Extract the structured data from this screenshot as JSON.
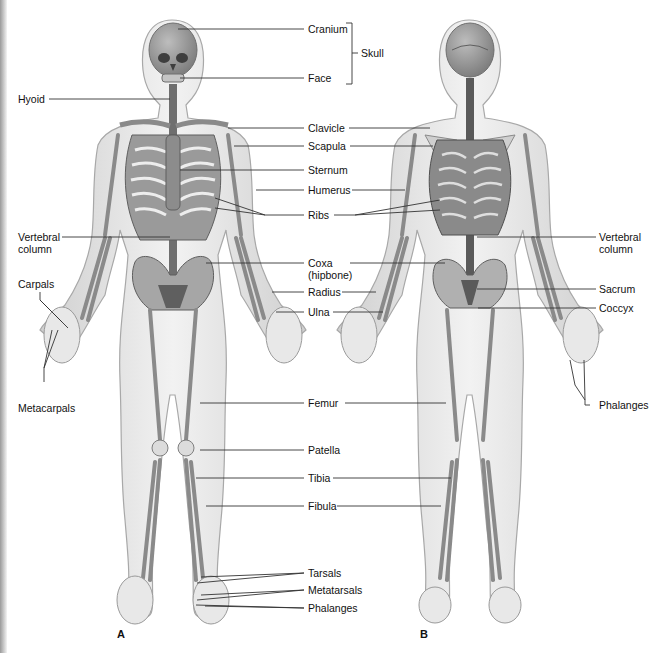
{
  "figure": {
    "panels": [
      {
        "id": "A",
        "label": "A",
        "view": "anterior"
      },
      {
        "id": "B",
        "label": "B",
        "view": "posterior"
      }
    ],
    "labels": {
      "cranium": "Cranium",
      "face": "Face",
      "skull": "Skull",
      "hyoid": "Hyoid",
      "clavicle": "Clavicle",
      "scapula": "Scapula",
      "sternum": "Sternum",
      "humerus": "Humerus",
      "ribs": "Ribs",
      "vertebral_column_left_1": "Vertebral",
      "vertebral_column_left_2": "column",
      "vertebral_column_right_1": "Vertebral",
      "vertebral_column_right_2": "column",
      "coxa_1": "Coxa",
      "coxa_2": "(hipbone)",
      "radius": "Radius",
      "ulna": "Ulna",
      "carpals": "Carpals",
      "metacarpals": "Metacarpals",
      "sacrum": "Sacrum",
      "coccyx": "Coccyx",
      "phalanges_hand": "Phalanges",
      "femur": "Femur",
      "patella": "Patella",
      "tibia": "Tibia",
      "fibula": "Fibula",
      "tarsals": "Tarsals",
      "metatarsals": "Metatarsals",
      "phalanges_foot": "Phalanges"
    },
    "colors": {
      "body_fill": "#e6e6e6",
      "body_outline": "#a8a8a8",
      "bone_fill": "#d2d2d2",
      "bone_dark": "#6f6f6f",
      "leader_line": "#333333"
    }
  }
}
